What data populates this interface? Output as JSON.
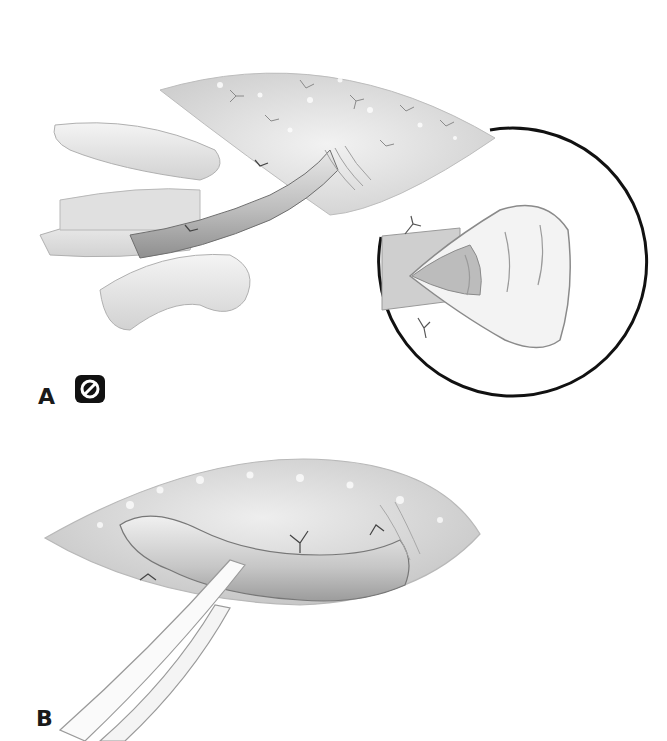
{
  "figure": {
    "panels": [
      {
        "id": "A",
        "label": "A",
        "description": "Vessel dissected within an incision, retracted by surrounding tissue; circular magnified inset shows the spatulated, flared open end of the vessel with ligated side branches.",
        "badge_icon": "prohibited-icon"
      },
      {
        "id": "B",
        "label": "B",
        "description": "Curved vessel exposed within an elliptical incision, encircled and lifted by a vessel loop; ligated branches visible."
      }
    ]
  },
  "colors": {
    "background": "#ffffff",
    "ink": "#1a1a1a",
    "tissue_light": "#e6e6e6",
    "tissue_mid": "#c8c8c8",
    "tissue_dark": "#9a9a9a",
    "inset_ring": "#111111"
  }
}
